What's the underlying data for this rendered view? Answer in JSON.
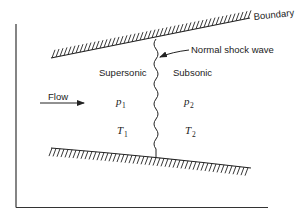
{
  "diagram": {
    "labels": {
      "boundary": "Boundary",
      "shock": "Normal shock wave",
      "supersonic": "Supersonic",
      "subsonic": "Subsonic",
      "flow": "Flow"
    },
    "upstream": {
      "p": "p",
      "p_sub": "1",
      "T": "T",
      "T_sub": "1"
    },
    "downstream": {
      "p": "p",
      "p_sub": "2",
      "T": "T",
      "T_sub": "2"
    },
    "colors": {
      "ink": "#222222",
      "background": "#ffffff"
    }
  }
}
